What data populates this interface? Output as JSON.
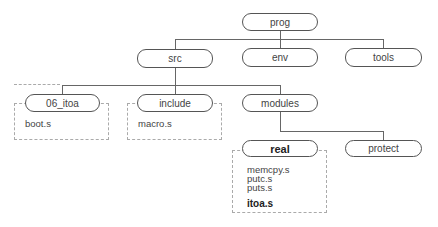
{
  "tree": {
    "root": {
      "label": "prog"
    },
    "level1": [
      {
        "label": "src"
      },
      {
        "label": "env"
      },
      {
        "label": "tools"
      }
    ],
    "src_children": [
      {
        "label": "06_itoa",
        "files": [
          "boot.s"
        ]
      },
      {
        "label": "include",
        "files": [
          "macro.s"
        ]
      },
      {
        "label": "modules"
      }
    ],
    "modules_children": [
      {
        "label": "real",
        "bold": true,
        "files": [
          "memcpy.s",
          "putc.s",
          "puts.s"
        ],
        "highlight_file": "itoa.s"
      },
      {
        "label": "protect"
      }
    ]
  }
}
